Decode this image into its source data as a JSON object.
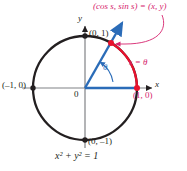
{
  "figure": {
    "title_caption": "Unit circle with arc length s equal to angle theta",
    "equation": "x² + y² = 1",
    "axis_labels": {
      "x": "x",
      "y": "y",
      "origin": "0"
    },
    "point_labels": {
      "top": "(0, 1)",
      "left": "(–1, 0)",
      "bottom": "(0, –1)",
      "right": "(1, 0)"
    },
    "annotations": {
      "coordinate_label": "(cos s, sin s) = (x, y)",
      "arc_label": "s = θ",
      "angle_label": "θ"
    },
    "colors": {
      "circle": "#231f20",
      "axis": "#808285",
      "ray": "#2b6cb8",
      "arc": "#e8112d",
      "label_red": "#d6246e",
      "callout": "#d6246e",
      "background": "#ffffff"
    },
    "geometry": {
      "center_x": 85,
      "center_y": 88,
      "radius": 52,
      "angle_degrees": 60,
      "arc_start_degrees": 0,
      "arc_end_degrees": 60
    }
  }
}
